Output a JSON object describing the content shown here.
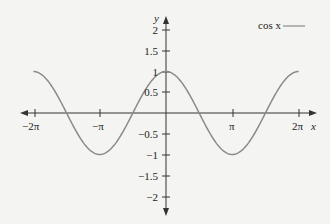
{
  "chart_data": {
    "type": "line",
    "title": "",
    "xlabel": "x",
    "ylabel": "y",
    "xlim": [
      -6.2832,
      6.2832
    ],
    "ylim": [
      -2,
      2
    ],
    "x_ticks": [
      "-2π",
      "-π",
      "π",
      "2π"
    ],
    "y_ticks": [
      "2",
      "1.5",
      "1",
      "0.5",
      "-0.5",
      "-1",
      "-1.5",
      "-2"
    ],
    "grid": false,
    "legend_position": "top-right",
    "series": [
      {
        "name": "cos x",
        "function": "cos(x)",
        "x": [
          -6.2832,
          -4.7124,
          -3.1416,
          -1.5708,
          0,
          1.5708,
          3.1416,
          4.7124,
          6.2832
        ],
        "values": [
          1,
          0,
          -1,
          0,
          1,
          0,
          -1,
          0,
          1
        ]
      }
    ]
  },
  "labels": {
    "x_axis": "x",
    "y_axis": "y",
    "legend": "cos x",
    "x_ticks": [
      "−2π",
      "−π",
      "π",
      "2π"
    ],
    "y_ticks": [
      "2",
      "1.5",
      "1",
      "0.5",
      "−0.5",
      "−1",
      "−1.5",
      "−2"
    ]
  },
  "colors": {
    "curve": "#8a8a8a",
    "axis": "#333333",
    "background": "#f4f4f2"
  }
}
